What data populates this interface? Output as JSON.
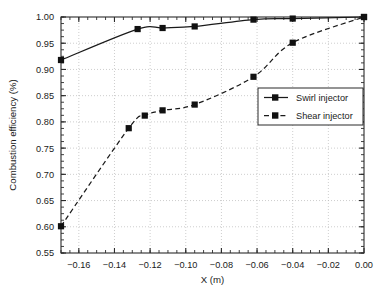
{
  "chart_data": {
    "type": "line",
    "title": "",
    "xlabel": "X (m)",
    "ylabel": "Combustion efficiency (%)",
    "xlim": [
      -0.17,
      0.0
    ],
    "ylim": [
      0.55,
      1.0
    ],
    "grid": true,
    "legend_position": "lower right",
    "x_ticks": [
      -0.16,
      -0.14,
      -0.12,
      -0.1,
      -0.08,
      -0.06,
      -0.04,
      -0.02,
      0.0
    ],
    "x_tick_labels": [
      "−0.16",
      "−0.14",
      "−0.12",
      "−0.10",
      "−0.08",
      "−0.06",
      "−0.04",
      "−0.02",
      "0.00"
    ],
    "y_ticks": [
      0.55,
      0.6,
      0.65,
      0.7,
      0.75,
      0.8,
      0.85,
      0.9,
      0.95,
      1.0
    ],
    "y_tick_labels": [
      "0.55",
      "0.60",
      "0.65",
      "0.70",
      "0.75",
      "0.80",
      "0.85",
      "0.90",
      "0.95",
      "1.00"
    ],
    "series": [
      {
        "name": "Swirl injector",
        "style": "solid",
        "marker": "square",
        "color": "#1a1a1a",
        "points": [
          {
            "x": -0.17,
            "y": 0.918
          },
          {
            "x": -0.127,
            "y": 0.977
          },
          {
            "x": -0.113,
            "y": 0.979
          },
          {
            "x": -0.095,
            "y": 0.982
          },
          {
            "x": -0.062,
            "y": 0.995
          },
          {
            "x": -0.04,
            "y": 0.997
          },
          {
            "x": 0.0,
            "y": 1.0
          }
        ]
      },
      {
        "name": "Shear injector",
        "style": "dashed",
        "marker": "square",
        "color": "#1a1a1a",
        "points": [
          {
            "x": -0.17,
            "y": 0.601
          },
          {
            "x": -0.132,
            "y": 0.788
          },
          {
            "x": -0.123,
            "y": 0.812
          },
          {
            "x": -0.113,
            "y": 0.822
          },
          {
            "x": -0.095,
            "y": 0.833
          },
          {
            "x": -0.062,
            "y": 0.886
          },
          {
            "x": -0.04,
            "y": 0.951
          },
          {
            "x": 0.0,
            "y": 1.0
          }
        ]
      }
    ]
  },
  "legend": {
    "entries": [
      {
        "label": "Swirl injector"
      },
      {
        "label": "Shear injector"
      }
    ]
  }
}
